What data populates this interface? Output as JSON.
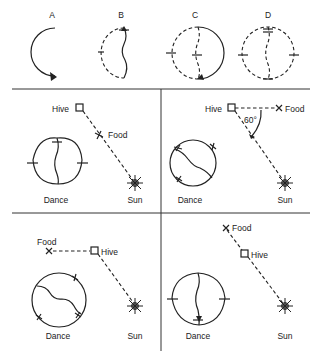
{
  "figure": {
    "top_row": {
      "labels": [
        "A",
        "B",
        "C",
        "D"
      ]
    },
    "panels": [
      {
        "position": "top-left",
        "hive_label": "Hive",
        "food_label": "Food",
        "dance_label": "Dance",
        "sun_label": "Sun"
      },
      {
        "position": "top-right",
        "hive_label": "Hive",
        "food_label": "Food",
        "angle_label": "60°",
        "dance_label": "Dance",
        "sun_label": "Sun"
      },
      {
        "position": "bottom-left",
        "hive_label": "Hive",
        "food_label": "Food",
        "dance_label": "Dance",
        "sun_label": "Sun"
      },
      {
        "position": "bottom-right",
        "hive_label": "Hive",
        "food_label": "Food",
        "dance_label": "Dance",
        "sun_label": "Sun"
      }
    ],
    "colors": {
      "ink": "#222222",
      "sun_fill": "#777777",
      "background": "#ffffff"
    }
  }
}
